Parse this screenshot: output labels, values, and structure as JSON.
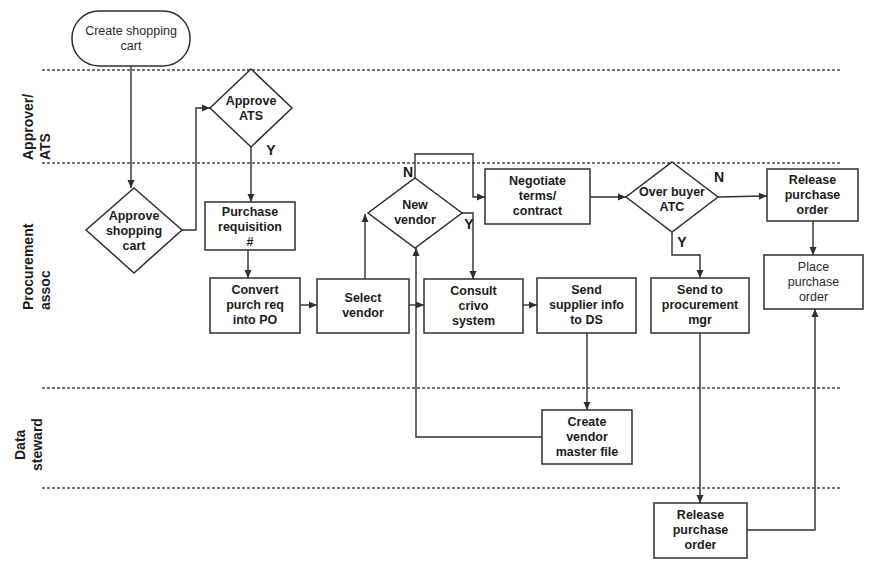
{
  "diagram": {
    "type": "swimlane-flowchart",
    "colors": {
      "line": "#2f2f2f",
      "text": "#1c1c1c",
      "background": "#ffffff"
    },
    "lanes": [
      {
        "id": "approver-ats",
        "label": "Approver/\nATS"
      },
      {
        "id": "procurement-assoc",
        "label": "Procurement\nassoc"
      },
      {
        "id": "data-steward",
        "label": "Data\nsteward"
      }
    ],
    "nodes": [
      {
        "id": "create-shopping-cart",
        "shape": "terminator",
        "lane": null,
        "label": "Create shopping\ncart"
      },
      {
        "id": "approve-shopping-cart",
        "shape": "decision",
        "lane": "procurement-assoc",
        "label": "Approve\nshopping\ncart"
      },
      {
        "id": "approve-ats",
        "shape": "decision",
        "lane": "approver-ats",
        "label": "Approve\nATS"
      },
      {
        "id": "purchase-requisition",
        "shape": "process",
        "lane": "procurement-assoc",
        "label": "Purchase\nrequisition\n#"
      },
      {
        "id": "convert-purch-req",
        "shape": "process",
        "lane": "procurement-assoc",
        "label": "Convert\npurch req\ninto PO"
      },
      {
        "id": "select-vendor",
        "shape": "process",
        "lane": "procurement-assoc",
        "label": "Select\nvendor"
      },
      {
        "id": "new-vendor",
        "shape": "decision",
        "lane": "procurement-assoc",
        "label": "New\nvendor"
      },
      {
        "id": "consult-crivo",
        "shape": "process",
        "lane": "procurement-assoc",
        "label": "Consult\ncrivo\nsystem"
      },
      {
        "id": "negotiate-terms",
        "shape": "process",
        "lane": "procurement-assoc",
        "label": "Negotiate\nterms/\ncontract"
      },
      {
        "id": "send-supplier-info",
        "shape": "process",
        "lane": "procurement-assoc",
        "label": "Send\nsupplier info\nto DS"
      },
      {
        "id": "over-buyer-atc",
        "shape": "decision",
        "lane": "procurement-assoc",
        "label": "Over buyer\nATC"
      },
      {
        "id": "release-po-top",
        "shape": "process",
        "lane": "procurement-assoc",
        "label": "Release\npurchase\norder"
      },
      {
        "id": "place-po",
        "shape": "process",
        "lane": "procurement-assoc",
        "label": "Place\npurchase\norder"
      },
      {
        "id": "send-to-proc-mgr",
        "shape": "process",
        "lane": "procurement-assoc",
        "label": "Send to\nprocurement\nmgr"
      },
      {
        "id": "create-vendor-master",
        "shape": "process",
        "lane": "data-steward",
        "label": "Create\nvendor\nmaster file"
      },
      {
        "id": "release-po-bottom",
        "shape": "process",
        "lane": null,
        "label": "Release\npurchase\norder"
      }
    ],
    "edges": [
      {
        "from": "create-shopping-cart",
        "to": "approve-shopping-cart",
        "label": ""
      },
      {
        "from": "approve-shopping-cart",
        "to": "approve-ats",
        "label": ""
      },
      {
        "from": "approve-ats",
        "to": "purchase-requisition",
        "label": "Y"
      },
      {
        "from": "purchase-requisition",
        "to": "convert-purch-req",
        "label": ""
      },
      {
        "from": "convert-purch-req",
        "to": "select-vendor",
        "label": ""
      },
      {
        "from": "select-vendor",
        "to": "new-vendor",
        "label": ""
      },
      {
        "from": "new-vendor",
        "to": "negotiate-terms",
        "label": "N"
      },
      {
        "from": "new-vendor",
        "to": "consult-crivo",
        "label": "Y"
      },
      {
        "from": "select-vendor",
        "to": "consult-crivo",
        "label": ""
      },
      {
        "from": "consult-crivo",
        "to": "send-supplier-info",
        "label": ""
      },
      {
        "from": "send-supplier-info",
        "to": "create-vendor-master",
        "label": ""
      },
      {
        "from": "create-vendor-master",
        "to": "new-vendor",
        "label": ""
      },
      {
        "from": "negotiate-terms",
        "to": "over-buyer-atc",
        "label": ""
      },
      {
        "from": "over-buyer-atc",
        "to": "release-po-top",
        "label": "N"
      },
      {
        "from": "over-buyer-atc",
        "to": "send-to-proc-mgr",
        "label": "Y"
      },
      {
        "from": "release-po-top",
        "to": "place-po",
        "label": ""
      },
      {
        "from": "send-to-proc-mgr",
        "to": "release-po-bottom",
        "label": ""
      },
      {
        "from": "release-po-bottom",
        "to": "place-po",
        "label": ""
      }
    ]
  }
}
